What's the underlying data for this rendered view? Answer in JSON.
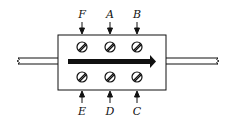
{
  "diagram": {
    "flow_direction": "left-to-right",
    "top_labels": [
      "F",
      "A",
      "B"
    ],
    "bottom_labels": [
      "E",
      "D",
      "C"
    ],
    "colors": {
      "stroke": "#111111",
      "background": "#ffffff"
    }
  }
}
